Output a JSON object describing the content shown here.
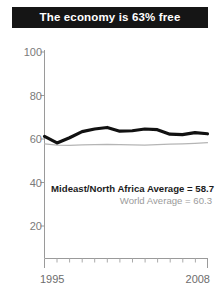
{
  "title": {
    "text": "The economy is 63% free"
  },
  "colors": {
    "banner_background": "#151515",
    "banner_text": "#ffffff",
    "region_line": "#111111",
    "world_line": "#b5b5b5",
    "axis": "#9a9a9a",
    "tick_label": "#7a7a7a",
    "annotation_region": "#1c1c1c",
    "annotation_world": "#9b9b9b",
    "plot_background": "#ffffff"
  },
  "axes": {
    "y_ticks": [
      "100",
      "80",
      "60",
      "40",
      "20"
    ],
    "x_ticks": [
      "1995",
      "2008"
    ]
  },
  "annotations": {
    "region_average": "Mideast/North Africa Average = 58.7",
    "world_average": "World Average = 60.3"
  },
  "chart_data": {
    "type": "line",
    "title": "The economy is 63% free",
    "xlabel": "",
    "ylabel": "",
    "xlim": [
      1995,
      2008
    ],
    "ylim": [
      0,
      100
    ],
    "yticks": [
      20,
      40,
      60,
      80,
      100
    ],
    "xticks": [
      1995,
      2008
    ],
    "grid": false,
    "legend": "none",
    "x": [
      1995,
      1996,
      1997,
      1998,
      1999,
      2000,
      2001,
      2002,
      2003,
      2004,
      2005,
      2006,
      2007,
      2008
    ],
    "series": [
      {
        "name": "Mideast/North Africa",
        "color": "#111111",
        "linewidth": 3.2,
        "values": [
          61.2,
          58.2,
          60.6,
          63.4,
          64.6,
          65.3,
          63.6,
          63.8,
          64.6,
          64.3,
          62.2,
          62.0,
          62.9,
          62.4
        ],
        "average": 58.7,
        "average_label": "Mideast/North Africa Average = 58.7"
      },
      {
        "name": "World",
        "color": "#b5b5b5",
        "linewidth": 1.2,
        "values": [
          57.8,
          57.2,
          57.1,
          57.3,
          57.4,
          57.5,
          57.4,
          57.3,
          57.2,
          57.4,
          57.6,
          57.8,
          58.0,
          58.3
        ],
        "average": 60.3,
        "average_label": "World Average = 60.3"
      }
    ]
  }
}
